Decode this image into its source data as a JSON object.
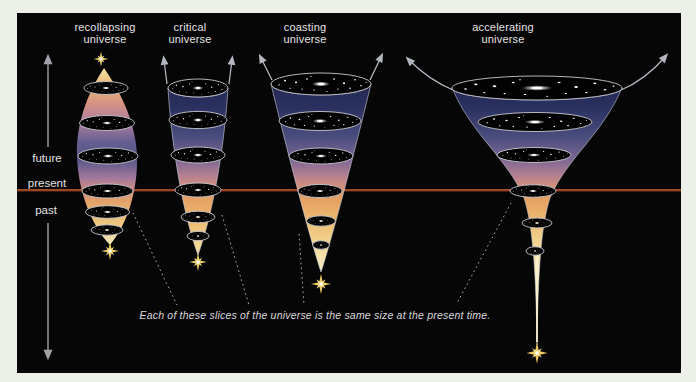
{
  "diagram": {
    "caption": "Each of these slices of the universe is the same size at the present time.",
    "time_axis": {
      "future": "future",
      "present": "present",
      "past": "past"
    },
    "universes": [
      {
        "name": "recollapsing universe",
        "label_line1": "recollapsing",
        "label_line2": "universe"
      },
      {
        "name": "critical universe",
        "label_line1": "critical",
        "label_line2": "universe"
      },
      {
        "name": "coasting universe",
        "label_line1": "coasting",
        "label_line2": "universe"
      },
      {
        "name": "accelerating universe",
        "label_line1": "accelerating",
        "label_line2": "universe"
      }
    ],
    "colors": {
      "present_line": "#a04a28",
      "frame_margin": "#edefe9",
      "panel_background": "#060606",
      "starburst": "#eccb62",
      "label_text": "#e3e3e3"
    }
  }
}
